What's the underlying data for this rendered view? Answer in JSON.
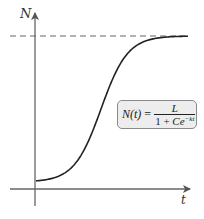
{
  "diagram": {
    "y_axis_label": "N",
    "x_axis_label": "t",
    "formula": {
      "lhs": "N(t)",
      "equals": "=",
      "numerator": "L",
      "denominator_prefix": "1 + ",
      "denominator_C": "C",
      "denominator_e": "e",
      "exponent": "−kt"
    },
    "colors": {
      "axis": "#666666",
      "curve": "#222222",
      "asymptote": "#666666",
      "box_fill": "#ededed",
      "box_border": "#8a8a8a"
    }
  },
  "chart_data": {
    "type": "line",
    "xlabel": "t",
    "ylabel": "N",
    "annotations": [
      "N(t) = L / (1 + Ce^(−kt))",
      "horizontal dashed asymptote at N = L"
    ],
    "asymptote": "L",
    "grid": false,
    "series": [
      {
        "name": "N(t)",
        "description": "S-shaped logistic curve starting near a small positive value at t=0, rising steepest in the middle, and leveling off at the asymptote L",
        "x": [
          0,
          0.1,
          0.2,
          0.3,
          0.4,
          0.5,
          0.6,
          0.7,
          0.8,
          0.9,
          1.0
        ],
        "values": [
          0.01,
          0.03,
          0.08,
          0.2,
          0.42,
          0.62,
          0.82,
          0.93,
          0.97,
          0.99,
          1.0
        ]
      }
    ]
  }
}
